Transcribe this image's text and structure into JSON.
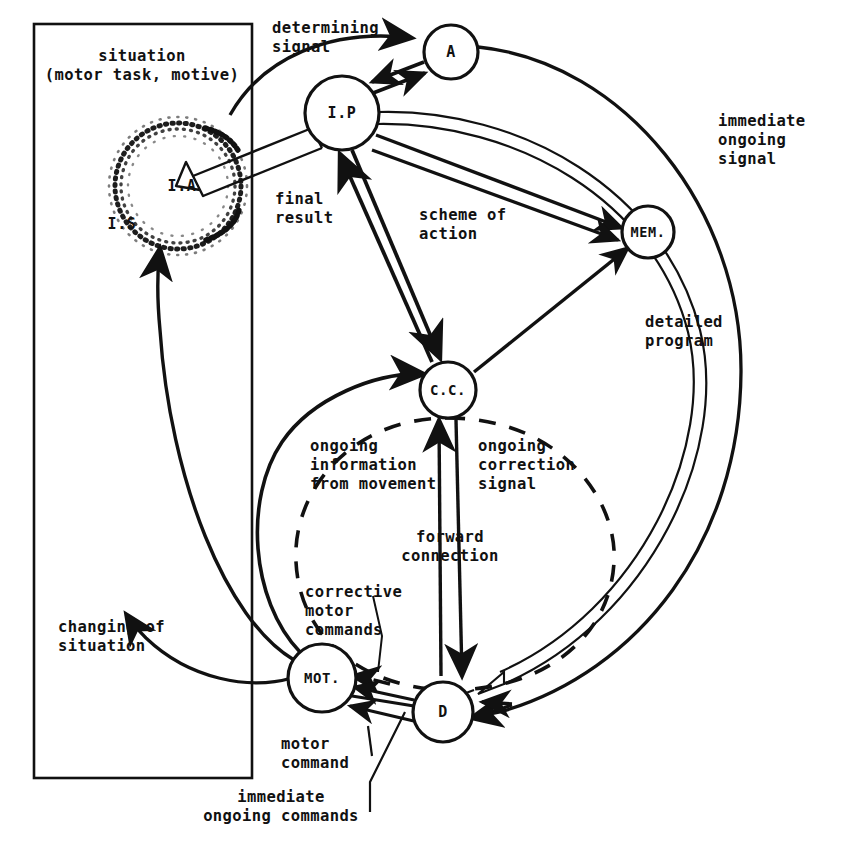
{
  "diagram": {
    "colors": {
      "ink": "#111111",
      "background": "#ffffff"
    },
    "nodes": [
      {
        "id": "ip",
        "label": "I.P",
        "cx": 342,
        "cy": 113,
        "r": 37
      },
      {
        "id": "a",
        "label": "A",
        "cx": 451,
        "cy": 52,
        "r": 27
      },
      {
        "id": "mem",
        "label": "MEM.",
        "cx": 648,
        "cy": 232,
        "r": 26
      },
      {
        "id": "cc",
        "label": "C.C.",
        "cx": 448,
        "cy": 390,
        "r": 28
      },
      {
        "id": "mot",
        "label": "MOT.",
        "cx": 322,
        "cy": 678,
        "r": 34
      },
      {
        "id": "d",
        "label": "D",
        "cx": 443,
        "cy": 712,
        "r": 30
      },
      {
        "id": "ia",
        "label": "I.A",
        "cx": 178,
        "cy": 186,
        "r": 62
      },
      {
        "id": "is",
        "label": "I.S",
        "cx": 120,
        "cy": 224,
        "r": 0
      }
    ],
    "labels": [
      {
        "id": "situation",
        "text": "situation\n(motor task, motive)",
        "x": 142,
        "y": 47,
        "align": "center"
      },
      {
        "id": "determining-signal",
        "text": "determining\nsignal",
        "x": 272,
        "y": 19,
        "align": "left"
      },
      {
        "id": "immediate-ongoing-signal",
        "text": "immediate\nongoing\nsignal",
        "x": 718,
        "y": 112,
        "align": "left"
      },
      {
        "id": "final-result",
        "text": "final\nresult",
        "x": 275,
        "y": 190,
        "align": "left"
      },
      {
        "id": "scheme-of-action",
        "text": "scheme of\naction",
        "x": 419,
        "y": 206,
        "align": "left"
      },
      {
        "id": "detailed-program",
        "text": "detailed\nprogram",
        "x": 645,
        "y": 313,
        "align": "left"
      },
      {
        "id": "ongoing-information",
        "text": "ongoing\ninformation\nfrom movement",
        "x": 310,
        "y": 437,
        "align": "left"
      },
      {
        "id": "ongoing-correction",
        "text": "ongoing\ncorrection\nsignal",
        "x": 478,
        "y": 437,
        "align": "left"
      },
      {
        "id": "forward-connection",
        "text": "forward\nconnection",
        "x": 450,
        "y": 528,
        "align": "center"
      },
      {
        "id": "corrective-motor-commands",
        "text": "corrective\nmotor\ncommands",
        "x": 305,
        "y": 583,
        "align": "left"
      },
      {
        "id": "changing-of-situation",
        "text": "changing of\nsituation",
        "x": 58,
        "y": 618,
        "align": "left"
      },
      {
        "id": "motor-command",
        "text": "motor\ncommand",
        "x": 281,
        "y": 735,
        "align": "left"
      },
      {
        "id": "immediate-ongoing-commands",
        "text": "immediate\nongoing commands",
        "x": 281,
        "y": 788,
        "align": "center"
      }
    ],
    "edges": [
      {
        "id": "determining-signal-to-a",
        "from": "situation-box",
        "to": "a",
        "style": "solid-curve"
      },
      {
        "id": "ip-to-a",
        "from": "ip",
        "to": "a",
        "style": "solid-arrow"
      },
      {
        "id": "a-to-ip",
        "from": "a",
        "to": "ip",
        "style": "solid-arrow"
      },
      {
        "id": "ip-to-ia-final-result",
        "from": "ip",
        "to": "ia",
        "style": "hollow-double-arrow"
      },
      {
        "id": "ip-to-mem-scheme-of-action",
        "from": "ip",
        "to": "mem",
        "style": "solid-arrow"
      },
      {
        "id": "ip-to-cc",
        "from": "ip",
        "to": "cc",
        "style": "solid-arrow"
      },
      {
        "id": "cc-to-ip",
        "from": "cc",
        "to": "ip",
        "style": "solid-arrow"
      },
      {
        "id": "cc-to-mem-detailed-program",
        "from": "cc",
        "to": "mem",
        "style": "solid-arrow"
      },
      {
        "id": "cc-to-d-forward-connection",
        "from": "cc",
        "to": "d",
        "style": "solid-arrow"
      },
      {
        "id": "d-to-cc-ongoing-correction",
        "from": "d",
        "to": "cc",
        "style": "solid-arrow"
      },
      {
        "id": "mot-to-cc-ongoing-information",
        "from": "mot",
        "to": "cc",
        "style": "solid-arrow"
      },
      {
        "id": "d-to-mot-motor-command",
        "from": "d",
        "to": "mot",
        "style": "solid-arrow"
      },
      {
        "id": "d-to-mot-corrective",
        "from": "d",
        "to": "mot",
        "style": "dashed-arrow"
      },
      {
        "id": "dashed-feedback-loop",
        "from": "mot",
        "to": "cc",
        "style": "dashed-ellipse"
      },
      {
        "id": "a-to-d-immediate-ongoing",
        "from": "a",
        "to": "d",
        "style": "solid-curve-arrow"
      },
      {
        "id": "ip-to-d-immediate-commands",
        "from": "ip",
        "to": "d",
        "style": "hollow-double-curve"
      },
      {
        "id": "mot-to-is-changing-situation",
        "from": "mot",
        "to": "is",
        "style": "solid-curve-arrow"
      },
      {
        "id": "mot-to-ia-changing-situation",
        "from": "mot",
        "to": "ia",
        "style": "solid-curve-arrow"
      }
    ]
  }
}
